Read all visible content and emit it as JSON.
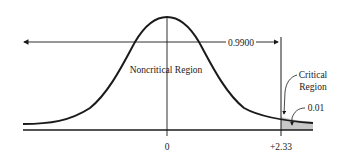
{
  "diagram": {
    "area_label": "0.9900",
    "noncritical_label": "Noncritical Region",
    "critical_label_line1": "Critical",
    "critical_label_line2": "Region",
    "tail_area_label": "0.01",
    "x_tick_center": "0",
    "x_tick_critical": "+2.33",
    "colors": {
      "line": "#1a1a1a",
      "shade": "#c8c8c8",
      "background": "#ffffff"
    }
  }
}
